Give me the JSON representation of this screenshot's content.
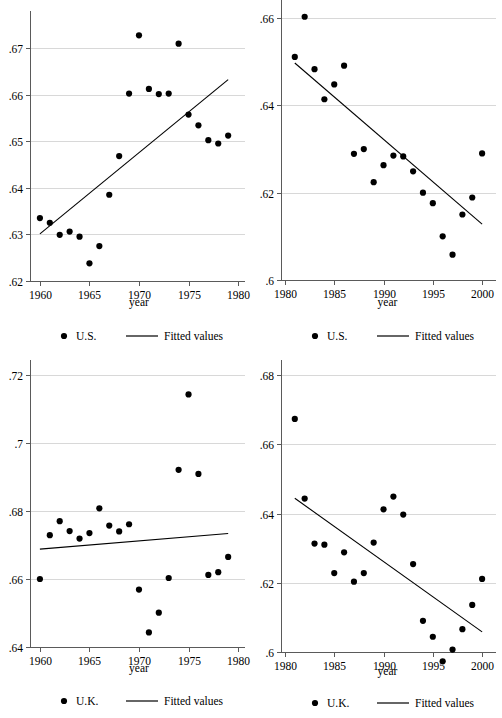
{
  "figure": {
    "panel_count": 4,
    "background_color": "#ffffff",
    "marker_color": "#000000",
    "gridline_color": "#d8d8d8",
    "axis_color": "#5a5a5a"
  },
  "chart_data": [
    {
      "id": "panel-top-left",
      "type": "scatter",
      "title": "",
      "xlabel": "year",
      "ylabel": "",
      "xlim": [
        1959,
        1980.6
      ],
      "ylim": [
        0.62,
        0.6732
      ],
      "grid": true,
      "xticks": [
        1960,
        1965,
        1970,
        1975,
        1980
      ],
      "xtick_labels": [
        "1960",
        "1965",
        "1970",
        "1975",
        "1980"
      ],
      "yticks": [
        0.62,
        0.63,
        0.64,
        0.65,
        0.66,
        0.67
      ],
      "ytick_labels": [
        ".62",
        ".63",
        ".64",
        ".65",
        ".66",
        ".67"
      ],
      "legend": [
        {
          "marker": "dot",
          "label": "U.S."
        },
        {
          "marker": "line",
          "label": "Fitted values"
        }
      ],
      "legend_position": "below-axis",
      "series": [
        {
          "name": "U.S.",
          "marker": "dot",
          "x": [
            1960,
            1961,
            1962,
            1963,
            1964,
            1965,
            1966,
            1967,
            1968,
            1969,
            1970,
            1971,
            1972,
            1973,
            1974,
            1975,
            1976,
            1977,
            1978,
            1979
          ],
          "y": [
            0.6335,
            0.6325,
            0.6299,
            0.6306,
            0.6295,
            0.6238,
            0.6275,
            0.6385,
            0.6468,
            0.6602,
            0.6727,
            0.6612,
            0.6601,
            0.6602,
            0.6709,
            0.6557,
            0.6534,
            0.6502,
            0.6495,
            0.6512
          ]
        },
        {
          "name": "Fitted values",
          "marker": "line",
          "x": [
            1960,
            1979
          ],
          "y": [
            0.6301,
            0.6632
          ]
        }
      ]
    },
    {
      "id": "panel-top-right",
      "type": "scatter",
      "title": "",
      "xlabel": "year",
      "ylabel": "",
      "xlim": [
        1979.6,
        2000.8
      ],
      "ylim": [
        0.6,
        0.6607
      ],
      "grid": true,
      "xticks": [
        1980,
        1985,
        1990,
        1995,
        2000
      ],
      "xtick_labels": [
        "1980",
        "1985",
        "1990",
        "1995",
        "2000"
      ],
      "yticks": [
        0.6,
        0.62,
        0.64,
        0.66
      ],
      "ytick_labels": [
        ".6",
        ".62",
        ".64",
        ".66"
      ],
      "legend": [
        {
          "marker": "dot",
          "label": "U.S."
        },
        {
          "marker": "line",
          "label": "Fitted values"
        }
      ],
      "legend_position": "below-axis",
      "series": [
        {
          "name": "U.S.",
          "marker": "dot",
          "x": [
            1981,
            1982,
            1983,
            1984,
            1985,
            1986,
            1987,
            1988,
            1989,
            1990,
            1991,
            1992,
            1993,
            1994,
            1995,
            1996,
            1997,
            1998,
            1999,
            2000
          ],
          "y": [
            0.6511,
            0.6603,
            0.6483,
            0.6414,
            0.6448,
            0.6491,
            0.6289,
            0.63,
            0.6224,
            0.6263,
            0.6285,
            0.6283,
            0.6249,
            0.62,
            0.6176,
            0.61,
            0.6058,
            0.615,
            0.6189,
            0.629
          ]
        },
        {
          "name": "Fitted values",
          "marker": "line",
          "x": [
            1981,
            2000
          ],
          "y": [
            0.6497,
            0.6128
          ]
        }
      ]
    },
    {
      "id": "panel-bottom-left",
      "type": "scatter",
      "title": "",
      "xlabel": "year",
      "ylabel": "",
      "xlim": [
        1959,
        1980.6
      ],
      "ylim": [
        0.64,
        0.72
      ],
      "grid": true,
      "xticks": [
        1960,
        1965,
        1970,
        1975,
        1980
      ],
      "xtick_labels": [
        "1960",
        "1965",
        "1970",
        "1975",
        "1980"
      ],
      "yticks": [
        0.64,
        0.66,
        0.68,
        0.7,
        0.72
      ],
      "ytick_labels": [
        ".64",
        ".66",
        ".68",
        ".7",
        ".72"
      ],
      "legend": [
        {
          "marker": "dot",
          "label": "U.K."
        },
        {
          "marker": "line",
          "label": "Fitted values"
        }
      ],
      "legend_position": "below-axis",
      "series": [
        {
          "name": "U.K.",
          "marker": "dot",
          "x": [
            1960,
            1961,
            1962,
            1963,
            1964,
            1965,
            1966,
            1967,
            1968,
            1969,
            1970,
            1971,
            1972,
            1973,
            1974,
            1975,
            1976,
            1977,
            1978,
            1979
          ],
          "y": [
            0.66,
            0.6729,
            0.677,
            0.6741,
            0.6719,
            0.6735,
            0.6808,
            0.6757,
            0.674,
            0.6761,
            0.6569,
            0.6443,
            0.6501,
            0.6603,
            0.6921,
            0.7143,
            0.6909,
            0.6612,
            0.662,
            0.6665
          ]
        },
        {
          "name": "Fitted values",
          "marker": "line",
          "x": [
            1960,
            1979
          ],
          "y": [
            0.6688,
            0.6734
          ]
        }
      ]
    },
    {
      "id": "panel-bottom-right",
      "type": "scatter",
      "title": "",
      "xlabel": "year",
      "ylabel": "",
      "xlim": [
        1979.6,
        2000.8
      ],
      "ylim": [
        0.6,
        0.68
      ],
      "grid": true,
      "xticks": [
        1980,
        1985,
        1990,
        1995,
        2000
      ],
      "xtick_labels": [
        "1980",
        "1985",
        "1990",
        "1995",
        "2000"
      ],
      "yticks": [
        0.6,
        0.62,
        0.64,
        0.66,
        0.68
      ],
      "ytick_labels": [
        ".6",
        ".62",
        ".64",
        ".66",
        ".68"
      ],
      "legend": [
        {
          "marker": "dot",
          "label": "U.K."
        },
        {
          "marker": "line",
          "label": "Fitted values"
        }
      ],
      "legend_position": "below-axis",
      "series": [
        {
          "name": "U.K.",
          "marker": "dot",
          "x": [
            1981,
            1982,
            1983,
            1984,
            1985,
            1986,
            1987,
            1988,
            1989,
            1990,
            1991,
            1992,
            1993,
            1994,
            1995,
            1996,
            1997,
            1998,
            1999,
            2000
          ],
          "y": [
            0.6673,
            0.6443,
            0.6313,
            0.631,
            0.6228,
            0.6288,
            0.6203,
            0.6228,
            0.6316,
            0.6412,
            0.6449,
            0.6397,
            0.6254,
            0.609,
            0.6044,
            0.5973,
            0.6007,
            0.6066,
            0.6136,
            0.6211
          ]
        },
        {
          "name": "Fitted values",
          "marker": "line",
          "x": [
            1981,
            2000
          ],
          "y": [
            0.6444,
            0.6058
          ]
        }
      ]
    }
  ]
}
